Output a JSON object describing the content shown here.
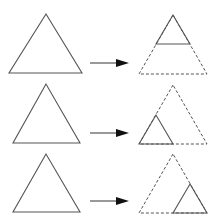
{
  "diagram": {
    "colors": {
      "stroke": "#555555",
      "arrow_head": "#111111",
      "background": "#ffffff"
    },
    "rows": [
      {
        "source": {
          "points": "46,14 9,73 82,73"
        },
        "arrow": {
          "x1": 90,
          "y1": 63,
          "x2": 120,
          "y2": 63,
          "head": "116,59 129,63 116,67"
        },
        "target_outline": {
          "points": "173,15 139,74 207,74"
        },
        "target_solid": {
          "points": "173,15 156,44 190,44",
          "label": "top corner"
        }
      },
      {
        "source": {
          "points": "46,84 13,143 80,143"
        },
        "arrow": {
          "x1": 90,
          "y1": 133,
          "x2": 120,
          "y2": 133,
          "head": "116,129 129,133 116,137"
        },
        "target_outline": {
          "points": "173,85 139,144 207,144"
        },
        "target_solid": {
          "points": "156,115 139,144 173,144",
          "label": "bottom-left corner"
        }
      },
      {
        "source": {
          "points": "46,154 13,212 80,212"
        },
        "arrow": {
          "x1": 90,
          "y1": 201,
          "x2": 120,
          "y2": 201,
          "head": "116,197 129,201 116,205"
        },
        "target_outline": {
          "points": "173,154 139,213 207,213"
        },
        "target_solid": {
          "points": "190,184 173,213 207,213",
          "label": "bottom-right corner"
        }
      }
    ]
  }
}
